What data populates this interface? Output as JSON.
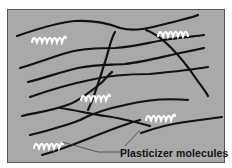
{
  "diagram": {
    "label": "Plasticizer molecules",
    "colors": {
      "background": "#a9a9a9",
      "polymer_chains": "#111111",
      "plasticizer": "#ffffff",
      "pointer_lines": "#444444",
      "frame_border": "#555555"
    },
    "elements": {
      "polymer_chains": 9,
      "plasticizer_molecules": 5
    }
  }
}
